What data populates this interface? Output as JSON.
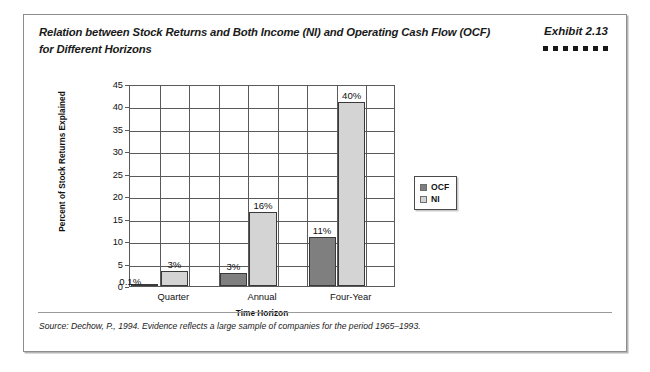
{
  "exhibit": {
    "title": "Relation between Stock Returns and Both Income (NI) and Operating Cash Flow (OCF) for Different Horizons",
    "number": "Exhibit 2.13",
    "dot_count": 7,
    "source_note": "Source: Dechow, P., 1994. Evidence reflects a large sample of companies for the period 1965–1993."
  },
  "chart_data": {
    "type": "bar",
    "title": "Relation between Stock Returns and Both Income (NI) and Operating Cash Flow (OCF) for Different Horizons",
    "xlabel": "Time Horizon",
    "ylabel": "Percent of Stock Returns Explained",
    "categories": [
      "Quarter",
      "Annual",
      "Four-Year"
    ],
    "series": [
      {
        "name": "OCF",
        "color": "#7f7f7f",
        "values": [
          0.1,
          3,
          11
        ],
        "labels": [
          "0.1%",
          "3%",
          "11%"
        ]
      },
      {
        "name": "NI",
        "color": "#d4d4d4",
        "values": [
          3.4,
          16.4,
          41
        ],
        "labels": [
          "3%",
          "16%",
          "40%"
        ]
      }
    ],
    "ylim": [
      0,
      45
    ],
    "yticks": [
      0,
      5,
      10,
      15,
      20,
      25,
      30,
      35,
      40,
      45
    ],
    "ytick_labels": [
      "0",
      "5",
      "10",
      "15",
      "20",
      "25",
      "30",
      "35",
      "40",
      "45"
    ],
    "grid": true,
    "grid_axis": "y",
    "legend_position": "right",
    "legend_entries": [
      "OCF",
      "NI"
    ]
  }
}
